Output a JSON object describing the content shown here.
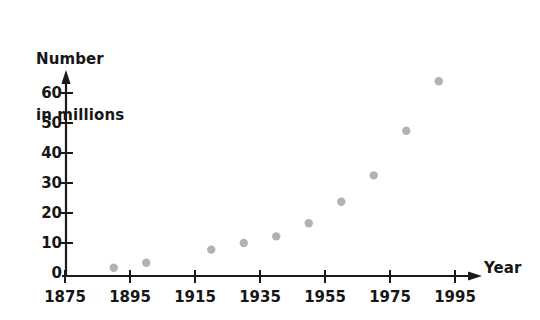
{
  "chart_data": {
    "type": "scatter",
    "title": "",
    "ylabel": "Number\nin millions",
    "ylabel_lines": [
      "Number",
      "in millions"
    ],
    "xlabel": "Year",
    "xlim": [
      1875,
      2001
    ],
    "ylim": [
      0,
      65
    ],
    "xticks": [
      1875,
      1895,
      1915,
      1935,
      1955,
      1975,
      1995
    ],
    "xtick_labels": [
      "1875",
      "1895",
      "1915",
      "1935",
      "1955",
      "1975",
      "1995"
    ],
    "yticks": [
      0,
      10,
      20,
      30,
      40,
      50,
      60
    ],
    "ytick_labels": [
      "0",
      "10",
      "20",
      "30",
      "40",
      "50",
      "60"
    ],
    "grid": false,
    "legend": false,
    "marker_color": "#b2b2b2",
    "axis_color": "#1a1a1a",
    "points": [
      {
        "x": 1890,
        "y": 2.5
      },
      {
        "x": 1900,
        "y": 4
      },
      {
        "x": 1920,
        "y": 8
      },
      {
        "x": 1930,
        "y": 10
      },
      {
        "x": 1940,
        "y": 12
      },
      {
        "x": 1950,
        "y": 16
      },
      {
        "x": 1960,
        "y": 22.5
      },
      {
        "x": 1970,
        "y": 30.5
      },
      {
        "x": 1980,
        "y": 44
      },
      {
        "x": 1990,
        "y": 59
      }
    ],
    "series": [
      {
        "name": "Number in millions",
        "x": [
          1890,
          1900,
          1920,
          1930,
          1940,
          1950,
          1960,
          1970,
          1980,
          1990
        ],
        "values": [
          2.5,
          4,
          8,
          10,
          12,
          16,
          22.5,
          30.5,
          44,
          59
        ]
      }
    ]
  }
}
